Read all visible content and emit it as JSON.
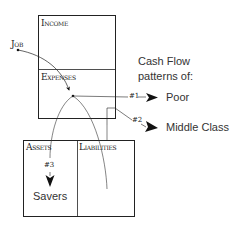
{
  "diagram": {
    "income_statement": {
      "income_label": "Income",
      "expenses_label": "Expenses"
    },
    "balance_sheet": {
      "assets_label": "Assets",
      "liabilities_label": "Liabilities"
    },
    "source_label": "Job",
    "caption": {
      "line1": "Cash Flow",
      "line2": "patterns of:"
    },
    "patterns": [
      {
        "marker": "#1",
        "label": "Poor"
      },
      {
        "marker": "#2",
        "label": "Middle Class"
      },
      {
        "marker": "#3",
        "label": "Savers"
      }
    ],
    "colors": {
      "line": "#222222",
      "text": "#333333",
      "background": "#ffffff"
    }
  }
}
